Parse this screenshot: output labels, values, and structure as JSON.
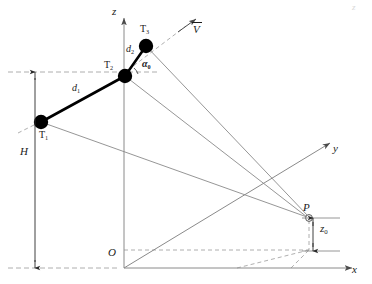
{
  "figure": {
    "type": "3d-kinematics-diagram",
    "background_color": "#ffffff",
    "line_color": "#808080",
    "node_color": "#000000",
    "text_color": "#1a1a1a"
  },
  "axes": {
    "z_label": "z",
    "x_label": "x",
    "y_label": "y",
    "origin_label": "O"
  },
  "nodes": [
    {
      "id": "T1",
      "base": "T",
      "subscript": "1",
      "x": 41,
      "y": 122,
      "r": 7.2,
      "style": "filled"
    },
    {
      "id": "T2",
      "base": "T",
      "subscript": "2",
      "x": 125,
      "y": 76,
      "r": 7.2,
      "style": "filled"
    },
    {
      "id": "T3",
      "base": "T",
      "subscript": "3",
      "x": 146,
      "y": 46,
      "r": 7.2,
      "style": "filled"
    },
    {
      "id": "P",
      "base": "P",
      "subscript": "",
      "x": 309,
      "y": 218,
      "r": 3.4,
      "style": "open"
    }
  ],
  "segments": [
    {
      "id": "d1",
      "base": "d",
      "subscript": "1",
      "from": "T1",
      "to": "T2",
      "label_x": 72,
      "label_y": 89
    },
    {
      "id": "d2",
      "base": "d",
      "subscript": "2",
      "from": "T2",
      "to": "T3",
      "label_x": 128,
      "label_y": 48
    }
  ],
  "angle": {
    "id": "alpha0",
    "base": "α",
    "subscript": "0",
    "label_x": 143,
    "label_y": 63,
    "vertex_x": 125,
    "vertex_y": 76
  },
  "vector": {
    "id": "V",
    "base": "V",
    "subscript": "",
    "label_x": 194,
    "label_y": 30,
    "overbar": true,
    "tail_x": 146,
    "tail_y": 46,
    "tip_x": 196,
    "tip_y": 22
  },
  "dimensions": [
    {
      "id": "H",
      "base": "H",
      "subscript": "",
      "label_x": 22,
      "label_y": 152,
      "line_x": 35,
      "top_y": 72,
      "bottom_y": 268,
      "orientation": "vertical"
    },
    {
      "id": "z0",
      "base": "z",
      "subscript": "0",
      "label_x": 322,
      "label_y": 228,
      "line_x": 312,
      "top_y": 218,
      "bottom_y": 252,
      "orientation": "vertical"
    }
  ],
  "corner_mark": {
    "text": "z"
  }
}
